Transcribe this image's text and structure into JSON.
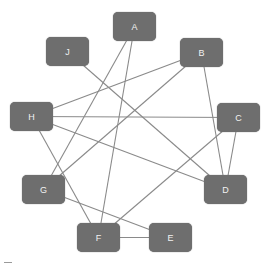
{
  "diagram": {
    "type": "graph",
    "node_color": "#6e6e6e",
    "edge_color": "#8a8a8a",
    "label_color": "#f2f2f2",
    "nodes": [
      {
        "id": "A",
        "label": "A",
        "x": 113,
        "y": 12
      },
      {
        "id": "B",
        "label": "B",
        "x": 180,
        "y": 38
      },
      {
        "id": "C",
        "label": "C",
        "x": 217,
        "y": 103
      },
      {
        "id": "D",
        "label": "D",
        "x": 204,
        "y": 175
      },
      {
        "id": "E",
        "label": "E",
        "x": 149,
        "y": 223
      },
      {
        "id": "F",
        "label": "F",
        "x": 77,
        "y": 223
      },
      {
        "id": "G",
        "label": "G",
        "x": 22,
        "y": 175
      },
      {
        "id": "H",
        "label": "H",
        "x": 10,
        "y": 102
      },
      {
        "id": "J",
        "label": "J",
        "x": 46,
        "y": 37
      }
    ],
    "edges": [
      [
        "A",
        "G"
      ],
      [
        "A",
        "F"
      ],
      [
        "J",
        "D"
      ],
      [
        "B",
        "H"
      ],
      [
        "B",
        "G"
      ],
      [
        "B",
        "D"
      ],
      [
        "H",
        "C"
      ],
      [
        "H",
        "D"
      ],
      [
        "H",
        "F"
      ],
      [
        "C",
        "F"
      ],
      [
        "C",
        "D"
      ],
      [
        "G",
        "E"
      ],
      [
        "F",
        "E"
      ]
    ]
  }
}
